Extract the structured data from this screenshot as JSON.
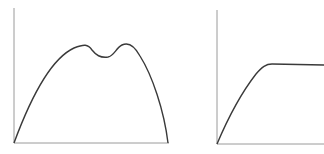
{
  "colors": {
    "background": "#ffffff",
    "axis": "#9a9a9a",
    "curve": "#3a3a3a"
  },
  "diagrams": [
    {
      "name": "bimodal-curve",
      "description": "Curve rising from origin to two peaks with a dip between them, then falling back to baseline",
      "axes": {
        "origin": [
          14,
          143
        ],
        "y_top": [
          14,
          8
        ],
        "x_end": [
          169,
          143
        ]
      },
      "path": "M14,143 C28,105 48,60 74,48 C84,44 88,44 92,50 C96,55 100,58 108,57 C114,56 116,48 122,45 C128,42 134,45 140,56 C152,75 164,110 168,143"
    },
    {
      "name": "saturation-curve",
      "description": "Curve rising from origin and leveling off into a flat plateau",
      "axes": {
        "origin": [
          217,
          144
        ],
        "y_top": [
          217,
          10
        ],
        "x_end": [
          324,
          144
        ]
      },
      "path": "M217,144 C228,118 242,92 256,74 C262,67 266,64 272,64 L324,65"
    }
  ]
}
